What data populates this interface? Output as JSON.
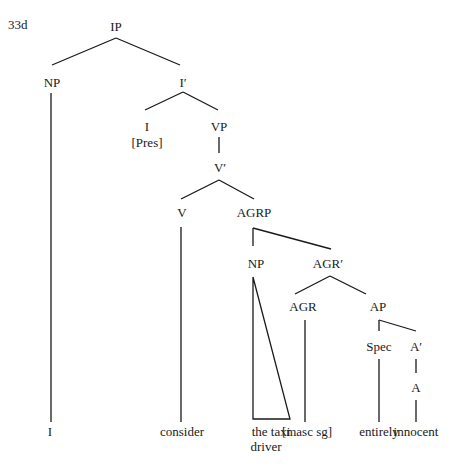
{
  "example_label": "33d",
  "colors": {
    "ink": "#1a1a1a",
    "background": "#ffffff"
  },
  "nodes": [
    {
      "id": "IP",
      "label": "IP",
      "x": 116,
      "y": 31
    },
    {
      "id": "NP1",
      "label": "NP",
      "x": 52,
      "y": 87
    },
    {
      "id": "Ibar",
      "label": "I′",
      "x": 183,
      "y": 87
    },
    {
      "id": "I",
      "label": "I",
      "x": 147,
      "y": 131
    },
    {
      "id": "Pres",
      "label": "[Pres]",
      "x": 147,
      "y": 147
    },
    {
      "id": "VP",
      "label": "VP",
      "x": 219,
      "y": 131
    },
    {
      "id": "Vbar",
      "label": "V′",
      "x": 220,
      "y": 172
    },
    {
      "id": "V",
      "label": "V",
      "x": 182,
      "y": 217
    },
    {
      "id": "AGRP",
      "label": "AGRP",
      "x": 254,
      "y": 217
    },
    {
      "id": "NP2",
      "label": "NP",
      "x": 256,
      "y": 268
    },
    {
      "id": "AGRbar",
      "label": "AGR′",
      "x": 328,
      "y": 268
    },
    {
      "id": "AGR",
      "label": "AGR",
      "x": 303,
      "y": 311
    },
    {
      "id": "AP",
      "label": "AP",
      "x": 378,
      "y": 311
    },
    {
      "id": "Spec",
      "label": "Spec",
      "x": 379,
      "y": 351
    },
    {
      "id": "Abar",
      "label": "A′",
      "x": 416,
      "y": 351
    },
    {
      "id": "A",
      "label": "A",
      "x": 416,
      "y": 392
    }
  ],
  "leaves": [
    {
      "id": "w_I",
      "label": "I",
      "x": 50,
      "y": 436
    },
    {
      "id": "w_consider",
      "label": "consider",
      "x": 182,
      "y": 436
    },
    {
      "id": "w_the_taxi",
      "label": "the taxi",
      "x": 271,
      "y": 436
    },
    {
      "id": "w_driver",
      "label": "driver",
      "x": 266,
      "y": 451
    },
    {
      "id": "w_masc_sg",
      "label": "[masc sg]",
      "x": 307,
      "y": 436
    },
    {
      "id": "w_entirely",
      "label": "entirely",
      "x": 379,
      "y": 436
    },
    {
      "id": "w_innocent",
      "label": "innocent",
      "x": 416,
      "y": 436
    }
  ],
  "edges": [
    {
      "x1": 116,
      "y1": 38,
      "x2": 52,
      "y2": 65
    },
    {
      "x1": 116,
      "y1": 38,
      "x2": 180,
      "y2": 65
    },
    {
      "x1": 51,
      "y1": 93,
      "x2": 51,
      "y2": 422
    },
    {
      "x1": 183,
      "y1": 92,
      "x2": 145,
      "y2": 110
    },
    {
      "x1": 183,
      "y1": 92,
      "x2": 218,
      "y2": 110
    },
    {
      "x1": 219,
      "y1": 137,
      "x2": 219,
      "y2": 153
    },
    {
      "x1": 219,
      "y1": 180,
      "x2": 181,
      "y2": 199
    },
    {
      "x1": 219,
      "y1": 180,
      "x2": 254,
      "y2": 199
    },
    {
      "x1": 181,
      "y1": 227,
      "x2": 181,
      "y2": 422
    },
    {
      "x1": 253,
      "y1": 228,
      "x2": 253,
      "y2": 246
    },
    {
      "x1": 253,
      "y1": 228,
      "x2": 331,
      "y2": 249
    },
    {
      "x1": 330,
      "y1": 276,
      "x2": 295,
      "y2": 294
    },
    {
      "x1": 330,
      "y1": 276,
      "x2": 366,
      "y2": 294
    },
    {
      "x1": 305,
      "y1": 320,
      "x2": 305,
      "y2": 422
    },
    {
      "x1": 379,
      "y1": 320,
      "x2": 379,
      "y2": 331
    },
    {
      "x1": 379,
      "y1": 320,
      "x2": 416,
      "y2": 331
    },
    {
      "x1": 416,
      "y1": 359,
      "x2": 416,
      "y2": 373
    },
    {
      "x1": 379,
      "y1": 359,
      "x2": 379,
      "y2": 422
    },
    {
      "x1": 416,
      "y1": 400,
      "x2": 416,
      "y2": 422
    }
  ],
  "triangles": [
    {
      "points": "253,277 253,419 290,419"
    }
  ]
}
